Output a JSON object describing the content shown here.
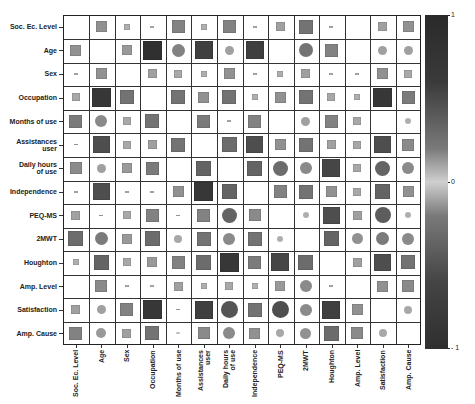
{
  "chart_data": {
    "type": "heatmap",
    "subtype": "correlation-matrix (upper triangle squares, lower triangle circles/squares, size and shade encode |r|)",
    "title": "",
    "variables": [
      "Soc. Ec. Level",
      "Age",
      "Sex",
      "Occupation",
      "Months of use",
      "Assistances user",
      "Daily hours of use",
      "Independence",
      "PEQ-MS",
      "2MWT",
      "Houghton",
      "Amp. Level",
      "Satisfaction",
      "Amp. Cause"
    ],
    "row_labels": [
      "Soc. Ec. Level",
      "Age",
      "Sex",
      "Occupation",
      "Months of use",
      "Assistances\nuser",
      "Daily hours\nof use",
      "Independence",
      "PEQ-MS",
      "2MWT",
      "Houghton",
      "Amp. Level",
      "Satisfaction",
      "Amp. Cause"
    ],
    "col_labels": [
      "Soc. Ec. Level",
      "Age",
      "Sex",
      "Occupation",
      "Months of use",
      "Assistances\nuser",
      "Daily hours\nof use",
      "Independence",
      "PEQ-MS",
      "2MWT",
      "Houghton",
      "Amp. Level",
      "Satisfaction",
      "Amp. Cause"
    ],
    "colorbar": {
      "min": -1,
      "max": 1,
      "ticks": [
        "1",
        "0",
        "-1"
      ]
    },
    "grid": true,
    "legend_position": "right (colorbar)",
    "matrix_abs_strength": [
      [
        0,
        0.3,
        0.1,
        0.05,
        0.4,
        0.1,
        0.4,
        0.05,
        0.2,
        0.5,
        0.05,
        0,
        0.2,
        0.3
      ],
      [
        0.3,
        0,
        0.25,
        0.95,
        0.4,
        0.85,
        0.2,
        0.85,
        0,
        0.5,
        0.4,
        0,
        0.2,
        0.2
      ],
      [
        0.05,
        0.3,
        0,
        0.2,
        0.15,
        0.1,
        0.3,
        0.05,
        0.1,
        0.2,
        0.05,
        0.05,
        0.3,
        0.15
      ],
      [
        0.15,
        0.9,
        0.5,
        0,
        0.5,
        0.3,
        0.5,
        0.1,
        0.3,
        0.5,
        0.15,
        0.1,
        0.9,
        0.45
      ],
      [
        0.45,
        0.35,
        0.15,
        0.5,
        0,
        0.45,
        0.05,
        0.4,
        0,
        0.2,
        0.4,
        0.15,
        0,
        0.1
      ],
      [
        0.05,
        0.75,
        0.15,
        0.2,
        0.5,
        0,
        0.55,
        0.75,
        0.3,
        0.5,
        0.2,
        0.15,
        0.75,
        0.35
      ],
      [
        0.35,
        0.2,
        0.25,
        0.45,
        0,
        0.6,
        0,
        0.6,
        0.55,
        0.35,
        0.8,
        0.15,
        0.6,
        0.35
      ],
      [
        0.05,
        0.75,
        0.05,
        0.05,
        0.3,
        0.9,
        0.6,
        0,
        0.4,
        0.5,
        0.3,
        0.15,
        0.6,
        0.3
      ],
      [
        0.2,
        0.05,
        0.15,
        0.4,
        0.05,
        0.4,
        0.6,
        0.35,
        0,
        0.1,
        0.75,
        0.2,
        0.65,
        0.1
      ],
      [
        0.55,
        0.45,
        0.25,
        0.55,
        0.15,
        0.5,
        0.35,
        0.5,
        0.1,
        0,
        0.6,
        0.3,
        0.45,
        0.35
      ],
      [
        0.1,
        0.6,
        0.15,
        0.25,
        0.4,
        0.55,
        0.9,
        0.45,
        0.8,
        0.55,
        0,
        0.2,
        0.75,
        0.5
      ],
      [
        0,
        0.35,
        0.05,
        0.03,
        0.2,
        0.1,
        0.15,
        0.1,
        0.25,
        0.35,
        0.05,
        0,
        0.3,
        0.35
      ],
      [
        0.2,
        0.2,
        0.4,
        0.9,
        0.05,
        0.85,
        0.7,
        0.5,
        0.75,
        0.35,
        0.85,
        0.3,
        0,
        0.15
      ],
      [
        0.4,
        0.25,
        0.2,
        0.5,
        0.05,
        0.35,
        0.35,
        0.3,
        0.15,
        0.3,
        0.55,
        0.35,
        0.15,
        0
      ]
    ]
  },
  "labels": {
    "rows": [
      "Soc. Ec. Level",
      "Age",
      "Sex",
      "Occupation",
      "Months of use",
      "Assistances|user",
      "Daily hours|of use",
      "Independence",
      "PEQ-MS",
      "2MWT",
      "Houghton",
      "Amp. Level",
      "Satisfaction",
      "Amp. Cause"
    ],
    "cols": [
      "Soc. Ec. Level",
      "Age",
      "Sex",
      "Occupation",
      "Months of use",
      "Assistances|user",
      "Daily hours|of use",
      "Independence",
      "PEQ-MS",
      "2MWT",
      "Houghton",
      "Amp. Level",
      "Satisfaction",
      "Amp. Cause"
    ]
  },
  "colorbar_ticks": {
    "top": "1",
    "mid": "0",
    "bottom": "- 1"
  }
}
